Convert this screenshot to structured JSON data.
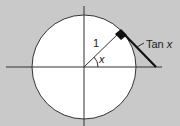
{
  "diagram": {
    "colors": {
      "background": "#c9c9c9",
      "circle_fill": "#ffffff",
      "line": "#222222"
    },
    "labels": {
      "radius": "1",
      "angle": "x",
      "tangent_prefix": "Tan ",
      "tangent_var": "x"
    }
  }
}
